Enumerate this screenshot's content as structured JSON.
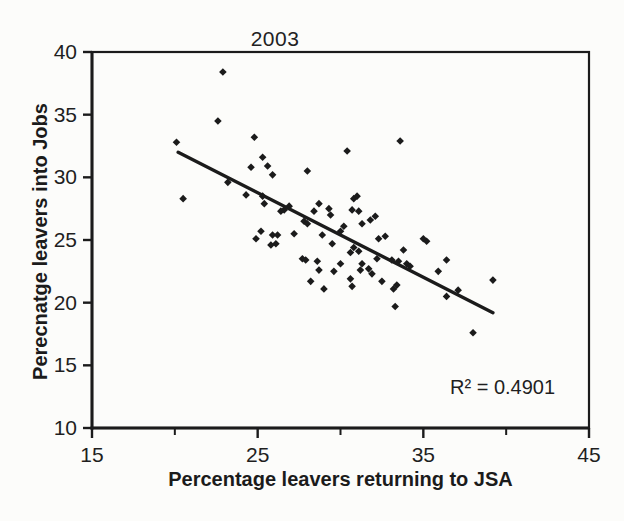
{
  "figure": {
    "background": "#fcfcfa",
    "ink_color": "#1b1b1b"
  },
  "chart_data": {
    "type": "scatter",
    "title": "2003",
    "xlabel": "Percentage leavers returning to JSA",
    "ylabel": "Perecnatge leavers into Jobs",
    "annotation": "R² = 0.4901",
    "r_squared": 0.4901,
    "xlim": [
      15,
      45
    ],
    "ylim": [
      10,
      40
    ],
    "xticks_major": [
      15,
      25,
      35,
      45
    ],
    "xticks_minor": [
      20,
      30,
      40
    ],
    "yticks": [
      40,
      35,
      30,
      25,
      20,
      15,
      10
    ],
    "grid": false,
    "legend": false,
    "marker": "diamond",
    "marker_color": "#1b1b1b",
    "trendline": {
      "x1": 20.2,
      "y1": 32.0,
      "x2": 39.2,
      "y2": 19.2
    },
    "points": [
      [
        22.9,
        38.4
      ],
      [
        22.6,
        34.5
      ],
      [
        20.1,
        32.8
      ],
      [
        24.8,
        33.2
      ],
      [
        20.5,
        28.3
      ],
      [
        25.3,
        31.6
      ],
      [
        25.6,
        30.9
      ],
      [
        24.6,
        30.8
      ],
      [
        25.9,
        30.2
      ],
      [
        23.2,
        29.6
      ],
      [
        24.3,
        28.6
      ],
      [
        25.3,
        28.5
      ],
      [
        25.4,
        27.9
      ],
      [
        24.9,
        25.1
      ],
      [
        26.6,
        27.4
      ],
      [
        25.2,
        25.7
      ],
      [
        25.9,
        25.4
      ],
      [
        26.2,
        25.4
      ],
      [
        26.1,
        24.7
      ],
      [
        25.8,
        24.6
      ],
      [
        30.4,
        32.1
      ],
      [
        33.6,
        32.9
      ],
      [
        28.0,
        30.5
      ],
      [
        26.9,
        27.7
      ],
      [
        26.4,
        27.3
      ],
      [
        27.2,
        25.5
      ],
      [
        27.8,
        26.5
      ],
      [
        28.0,
        26.3
      ],
      [
        28.4,
        27.3
      ],
      [
        28.7,
        27.9
      ],
      [
        29.3,
        27.5
      ],
      [
        29.4,
        27.0
      ],
      [
        28.9,
        25.4
      ],
      [
        29.5,
        24.7
      ],
      [
        30.2,
        26.1
      ],
      [
        30.8,
        28.3
      ],
      [
        31.0,
        28.5
      ],
      [
        30.7,
        27.4
      ],
      [
        31.1,
        27.3
      ],
      [
        31.3,
        26.3
      ],
      [
        31.8,
        26.6
      ],
      [
        32.1,
        26.9
      ],
      [
        30.8,
        24.4
      ],
      [
        31.1,
        24.1
      ],
      [
        30.6,
        24.0
      ],
      [
        30.0,
        25.7
      ],
      [
        32.3,
        25.1
      ],
      [
        32.7,
        25.3
      ],
      [
        32.2,
        23.5
      ],
      [
        31.3,
        23.1
      ],
      [
        31.7,
        22.7
      ],
      [
        31.2,
        22.6
      ],
      [
        30.6,
        21.9
      ],
      [
        31.9,
        22.3
      ],
      [
        30.7,
        21.3
      ],
      [
        29.0,
        21.1
      ],
      [
        28.2,
        21.7
      ],
      [
        27.7,
        23.5
      ],
      [
        27.9,
        23.4
      ],
      [
        28.6,
        23.3
      ],
      [
        28.7,
        22.6
      ],
      [
        29.6,
        22.5
      ],
      [
        30.0,
        23.1
      ],
      [
        33.1,
        23.4
      ],
      [
        33.5,
        23.3
      ],
      [
        33.8,
        24.2
      ],
      [
        34.0,
        23.1
      ],
      [
        33.2,
        21.1
      ],
      [
        33.4,
        21.4
      ],
      [
        34.2,
        22.9
      ],
      [
        35.0,
        25.1
      ],
      [
        35.2,
        24.9
      ],
      [
        36.4,
        23.4
      ],
      [
        35.9,
        22.5
      ],
      [
        37.1,
        21.0
      ],
      [
        36.4,
        20.5
      ],
      [
        39.2,
        21.8
      ],
      [
        33.3,
        19.7
      ],
      [
        38.0,
        17.6
      ],
      [
        32.5,
        21.7
      ]
    ]
  }
}
